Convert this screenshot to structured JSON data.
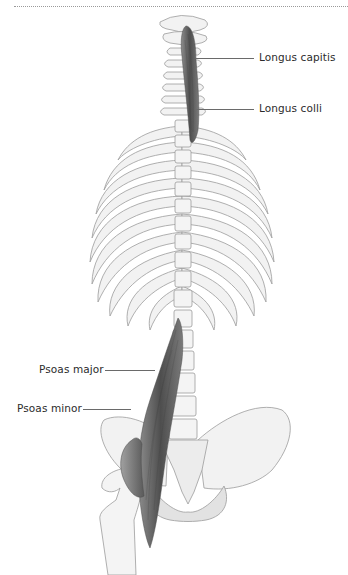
{
  "figure": {
    "type": "anatomical-illustration",
    "colors": {
      "bone_fill": "#f2f2f2",
      "bone_shade": "#dcdcdc",
      "bone_outline": "#9c9c9c",
      "muscle_dark": "#5a5a5a",
      "muscle_mid": "#8a8a8a",
      "label_text": "#2b2b2b",
      "leader_line": "#6a6a6a",
      "top_rule": "#9a9a9a"
    }
  },
  "labels": {
    "longus_capitis": "Longus capitis",
    "longus_colli": "Longus colli",
    "psoas_major": "Psoas major",
    "psoas_minor": "Psoas minor"
  }
}
